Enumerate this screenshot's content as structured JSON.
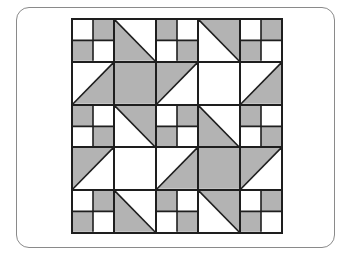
{
  "colors": {
    "gray": "#b3b3b3",
    "white": "#ffffff",
    "line": "#1e1e1e"
  },
  "quilt": {
    "rows": 5,
    "cols": 5,
    "blocks": [
      [
        {
          "type": "four-patch",
          "pattern": [
            "W",
            "G",
            "G",
            "W"
          ]
        },
        {
          "type": "hst",
          "diagonal": "tl-br",
          "gray": "bl"
        },
        {
          "type": "four-patch",
          "pattern": [
            "G",
            "W",
            "W",
            "G"
          ]
        },
        {
          "type": "hst",
          "diagonal": "tl-br",
          "gray": "tr"
        },
        {
          "type": "four-patch",
          "pattern": [
            "W",
            "G",
            "G",
            "W"
          ]
        }
      ],
      [
        {
          "type": "hst",
          "diagonal": "bl-tr",
          "gray": "br"
        },
        {
          "type": "solid",
          "fill": "G"
        },
        {
          "type": "hst",
          "diagonal": "bl-tr",
          "gray": "tl"
        },
        {
          "type": "solid",
          "fill": "W"
        },
        {
          "type": "hst",
          "diagonal": "bl-tr",
          "gray": "br"
        }
      ],
      [
        {
          "type": "four-patch",
          "pattern": [
            "G",
            "W",
            "W",
            "G"
          ]
        },
        {
          "type": "hst",
          "diagonal": "tl-br",
          "gray": "tr"
        },
        {
          "type": "four-patch",
          "pattern": [
            "W",
            "G",
            "G",
            "W"
          ]
        },
        {
          "type": "hst",
          "diagonal": "tl-br",
          "gray": "bl"
        },
        {
          "type": "four-patch",
          "pattern": [
            "G",
            "W",
            "W",
            "G"
          ]
        }
      ],
      [
        {
          "type": "hst",
          "diagonal": "bl-tr",
          "gray": "tl"
        },
        {
          "type": "solid",
          "fill": "W"
        },
        {
          "type": "hst",
          "diagonal": "bl-tr",
          "gray": "br"
        },
        {
          "type": "solid",
          "fill": "G"
        },
        {
          "type": "hst",
          "diagonal": "bl-tr",
          "gray": "tl"
        }
      ],
      [
        {
          "type": "four-patch",
          "pattern": [
            "W",
            "G",
            "G",
            "W"
          ]
        },
        {
          "type": "hst",
          "diagonal": "tl-br",
          "gray": "bl"
        },
        {
          "type": "four-patch",
          "pattern": [
            "G",
            "W",
            "W",
            "G"
          ]
        },
        {
          "type": "hst",
          "diagonal": "tl-br",
          "gray": "tr"
        },
        {
          "type": "four-patch",
          "pattern": [
            "W",
            "G",
            "G",
            "W"
          ]
        }
      ]
    ]
  }
}
